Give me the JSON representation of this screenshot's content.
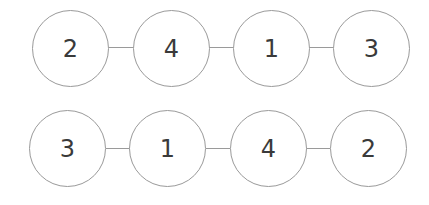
{
  "diagram": {
    "rows": [
      {
        "nodes": [
          {
            "label": "2"
          },
          {
            "label": "4"
          },
          {
            "label": "1"
          },
          {
            "label": "3"
          }
        ]
      },
      {
        "nodes": [
          {
            "label": "3"
          },
          {
            "label": "1"
          },
          {
            "label": "4"
          },
          {
            "label": "2"
          }
        ]
      }
    ],
    "colors": {
      "stroke": "#9a9a9a",
      "text": "#3a3a3a",
      "background": "#ffffff"
    }
  }
}
